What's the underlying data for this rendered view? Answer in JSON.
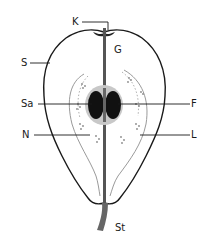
{
  "diagram": {
    "labels": {
      "K": "K",
      "G": "G",
      "S": "S",
      "Sa": "Sa",
      "F": "F",
      "N": "N",
      "L": "L",
      "St": "St"
    },
    "colors": {
      "outline": "#1a1a1a",
      "seed": "#111111",
      "core_ring": "#9a9a9a",
      "flesh": "#ffffff",
      "dots": "#8a8a8a"
    }
  }
}
